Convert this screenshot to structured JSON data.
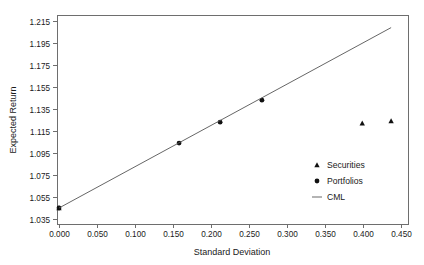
{
  "chart_data": {
    "type": "scatter",
    "title": "",
    "xlabel": "Standard Deviation",
    "ylabel": "Expected Return",
    "xlim": [
      0.0,
      0.45
    ],
    "ylim": [
      1.035,
      1.215
    ],
    "grid": false,
    "legend_position": "center-right",
    "xticks": [
      "0.000",
      "0.050",
      "0.100",
      "0.150",
      "0.200",
      "0.250",
      "0.300",
      "0.350",
      "0.400",
      "0.450"
    ],
    "xtick_values": [
      0.0,
      0.05,
      0.1,
      0.15,
      0.2,
      0.25,
      0.3,
      0.35,
      0.4,
      0.45
    ],
    "yticks": [
      "1.035",
      "1.055",
      "1.075",
      "1.095",
      "1.115",
      "1.135",
      "1.155",
      "1.175",
      "1.195",
      "1.215"
    ],
    "ytick_values": [
      1.035,
      1.055,
      1.075,
      1.095,
      1.115,
      1.135,
      1.155,
      1.175,
      1.195,
      1.215
    ],
    "series": [
      {
        "name": "Securities",
        "marker": "triangle",
        "color": "#111111",
        "points": [
          {
            "x": 0.0,
            "y": 1.045
          },
          {
            "x": 0.399,
            "y": 1.122
          },
          {
            "x": 0.437,
            "y": 1.124
          }
        ]
      },
      {
        "name": "Portfolios",
        "marker": "circle",
        "color": "#111111",
        "points": [
          {
            "x": 0.0,
            "y": 1.045
          },
          {
            "x": 0.158,
            "y": 1.104
          },
          {
            "x": 0.212,
            "y": 1.123
          },
          {
            "x": 0.267,
            "y": 1.143
          }
        ]
      },
      {
        "name": "CML",
        "marker": "line",
        "color": "#555555",
        "points": [
          {
            "x": 0.0,
            "y": 1.045
          },
          {
            "x": 0.437,
            "y": 1.209
          }
        ]
      }
    ],
    "legend": [
      {
        "label": "Securities",
        "marker": "triangle"
      },
      {
        "label": "Portfolios",
        "marker": "circle"
      },
      {
        "label": "CML",
        "marker": "line"
      }
    ]
  }
}
